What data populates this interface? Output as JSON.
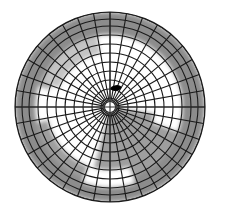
{
  "figure": {
    "type": "polar-grid-map",
    "title": "",
    "background_color": "#ffffff",
    "canvas": {
      "width": 226,
      "height": 211
    }
  },
  "chart_data": {
    "type": "heatmap",
    "projection": "polar",
    "title": "",
    "subtitle": "",
    "xlabel": "",
    "ylabel": "",
    "grid": true,
    "legend": "none",
    "center": {
      "x": 110,
      "y": 107
    },
    "outer_radius": 95,
    "inner_radius": 9,
    "radial_rings": 10,
    "angular_sectors": 36,
    "ring_radii": [
      9,
      18,
      27,
      36,
      45,
      54,
      63,
      72,
      81,
      88,
      95
    ],
    "tick_labels_radial": [],
    "tick_labels_angular": [],
    "grid_line_color": "#1a1a1a",
    "grid_line_width": 1.1,
    "palette": {
      "dark_gray": "#8c8c8c",
      "mid_gray": "#9e9e9e",
      "light_gray": "#c4c4c4",
      "white": "#ffffff",
      "black": "#000000"
    },
    "regions": [
      {
        "name": "outer-band",
        "shade": "dark_gray",
        "r_from": 72,
        "r_to": 95,
        "a_from": 0,
        "a_to": 360
      },
      {
        "name": "inner-white-field",
        "shade": "white",
        "r_from": 9,
        "r_to": 72,
        "a_from": 0,
        "a_to": 360
      },
      {
        "name": "lower-right-wedge",
        "shade": "mid_gray",
        "r_from": 9,
        "r_to": 72,
        "a_from": 8,
        "a_to": 105
      },
      {
        "name": "right-notch-white",
        "shade": "white",
        "r_from": 45,
        "r_to": 72,
        "a_from": -18,
        "a_to": 20
      },
      {
        "name": "lower-left-gray-arc",
        "shade": "mid_gray",
        "r_from": 63,
        "r_to": 76,
        "a_from": 110,
        "a_to": 205
      },
      {
        "name": "bottom-white-arc",
        "shade": "white",
        "r_from": 63,
        "r_to": 80,
        "a_from": 72,
        "a_to": 110
      },
      {
        "name": "left-white-notch",
        "shade": "white",
        "r_from": 63,
        "r_to": 74,
        "a_from": 168,
        "a_to": 196
      },
      {
        "name": "upper-left-gray-shade",
        "shade": "light_gray",
        "r_from": 54,
        "r_to": 72,
        "a_from": 200,
        "a_to": 260
      }
    ],
    "markers": [
      {
        "name": "lesion-marker",
        "shape": "ellipse",
        "color": "#000000",
        "cx": 116,
        "cy": 88,
        "rx": 5.5,
        "ry": 2.8,
        "rotation": -8
      }
    ],
    "axes": {
      "horizontal_axis_line": true,
      "vertical_axis_line": true,
      "axis_color": "#2a2a2a"
    }
  }
}
